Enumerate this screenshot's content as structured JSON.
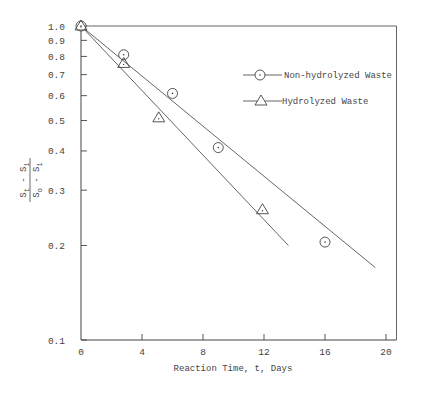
{
  "chart_data": {
    "type": "scatter",
    "title": "",
    "xlabel": "Reaction Time, t, Days",
    "ylabel": "(S_t - S_i) / (S_o - S_i)",
    "ylabel_parts": {
      "num_a": "S",
      "num_a_sub": "t",
      "num_op": "-",
      "num_b": "S",
      "num_b_sub": "i",
      "den_a": "S",
      "den_a_sub": "o",
      "den_op": "-",
      "den_b": "S",
      "den_b_sub": "i"
    },
    "xlim": [
      0,
      22
    ],
    "ylim": [
      0.1,
      1.0
    ],
    "yscale": "log",
    "grid": false,
    "x_ticks": [
      0,
      4,
      8,
      12,
      16,
      20
    ],
    "x_tick_labels": [
      "0",
      "4",
      "8",
      "12",
      "16",
      "20"
    ],
    "y_ticks": [
      1.0,
      0.9,
      0.8,
      0.7,
      0.6,
      0.5,
      0.4,
      0.3,
      0.2,
      0.1
    ],
    "y_tick_labels": [
      "1.0",
      "0.9",
      "0.8",
      "0.7",
      "0.6",
      "0.5",
      "0.4",
      "0.3",
      "0.2",
      "0.1"
    ],
    "legend_position": "upper right",
    "series": [
      {
        "name": "Non-hydrolyzed Waste",
        "marker": "circle-dot",
        "x": [
          0,
          2.8,
          6,
          9,
          16
        ],
        "y": [
          1.0,
          0.81,
          0.61,
          0.41,
          0.205
        ],
        "fit_line": {
          "x": [
            0,
            19.3
          ],
          "y": [
            1.0,
            0.17
          ]
        }
      },
      {
        "name": "Hydrolyzed Waste",
        "marker": "triangle",
        "x": [
          0,
          2.8,
          5.1,
          11.9
        ],
        "y": [
          1.0,
          0.76,
          0.51,
          0.26
        ],
        "fit_line": {
          "x": [
            0,
            13.6
          ],
          "y": [
            1.0,
            0.2
          ]
        }
      }
    ]
  },
  "legend": {
    "items": [
      {
        "label": "Non-hydrolyzed Waste"
      },
      {
        "label": "Hydrolyzed Waste"
      }
    ]
  }
}
